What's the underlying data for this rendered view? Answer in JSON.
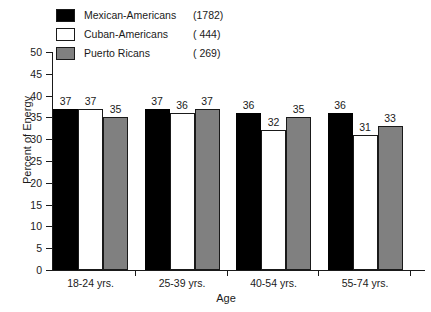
{
  "chart_data": {
    "type": "bar",
    "title": "",
    "xlabel": "Age",
    "ylabel": "Percent of Energy",
    "categories": [
      "18-24 yrs.",
      "25-39 yrs.",
      "40-54 yrs.",
      "55-74 yrs."
    ],
    "series": [
      {
        "name": "Mexican-Americans",
        "count": "(1782)",
        "color": "#000000",
        "values": [
          37,
          37,
          36,
          36
        ]
      },
      {
        "name": "Cuban-Americans",
        "count": "(    444)",
        "color": "#ffffff",
        "values": [
          37,
          36,
          32,
          31
        ]
      },
      {
        "name": "Puerto Ricans",
        "count": "(    269)",
        "color": "#808080",
        "values": [
          35,
          37,
          35,
          33
        ]
      }
    ],
    "ylim": [
      0,
      50
    ],
    "yticks": [
      0,
      5,
      10,
      15,
      20,
      25,
      30,
      35,
      40,
      45,
      50
    ],
    "ytick_labels": [
      "0",
      "5",
      "10",
      "15",
      "20",
      "25",
      "30",
      "35",
      "40",
      "45",
      "50"
    ],
    "grid": false,
    "legend_position": "top-left"
  },
  "legend": {
    "entries": [
      {
        "label": "Mexican-Americans",
        "count": "(1782)"
      },
      {
        "label": "Cuban-Americans",
        "count": "(  444)"
      },
      {
        "label": "Puerto Ricans",
        "count": "(  269)"
      }
    ]
  }
}
